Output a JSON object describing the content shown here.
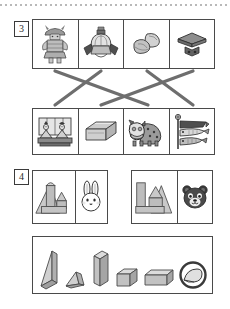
{
  "page": {
    "type": "worksheet",
    "top_rule": "dotted-line"
  },
  "question3": {
    "number": "3",
    "instruction_implied": "match-top-to-bottom-with-lines",
    "top_row": [
      {
        "id": "warrior-doll",
        "label": "musha-ningyo",
        "icon": "samurai-armor-doll-icon"
      },
      {
        "id": "kabuto-helmet",
        "label": "kabuto",
        "icon": "kabuto-helmet-icon"
      },
      {
        "id": "kashiwa-mochi",
        "label": "kashiwa-mochi",
        "icon": "rice-cake-icon"
      },
      {
        "id": "masu-stand",
        "label": "sanbo-stand",
        "icon": "wooden-stand-icon"
      }
    ],
    "bottom_row": [
      {
        "id": "hina-dolls",
        "label": "hina-ningyo",
        "icon": "hina-doll-pair-icon"
      },
      {
        "id": "box",
        "label": "hako",
        "icon": "open-box-icon"
      },
      {
        "id": "shishimai",
        "label": "shishimai",
        "icon": "lion-dance-icon"
      },
      {
        "id": "koinobori",
        "label": "koinobori",
        "icon": "carp-streamer-icon"
      }
    ],
    "connections": [
      {
        "from": 0,
        "to": 2
      },
      {
        "from": 1,
        "to": 0
      },
      {
        "from": 2,
        "to": 3
      },
      {
        "from": 3,
        "to": 1
      }
    ]
  },
  "question4": {
    "number": "4",
    "instruction_implied": "find-missing-block",
    "pairs": [
      {
        "id": "pair-a",
        "build": {
          "icon": "block-structure-a-icon",
          "label": "blocks-with-cylinder-and-triangle"
        },
        "face": {
          "icon": "rabbit-face-icon",
          "label": "usagi"
        }
      },
      {
        "id": "pair-b",
        "build": {
          "icon": "block-structure-b-icon",
          "label": "blocks-with-tall-bar-and-triangles"
        },
        "face": {
          "icon": "bear-face-icon",
          "label": "kuma"
        }
      }
    ],
    "shapes": [
      {
        "id": "shape-1",
        "icon": "right-triangular-prism-icon",
        "label": "triangular-prism-tall",
        "circled": false
      },
      {
        "id": "shape-2",
        "icon": "small-wedge-icon",
        "label": "small-wedge",
        "circled": false
      },
      {
        "id": "shape-3",
        "icon": "tall-rectangular-prism-icon",
        "label": "tall-bar",
        "circled": false
      },
      {
        "id": "shape-4",
        "icon": "cube-icon",
        "label": "cube",
        "circled": false
      },
      {
        "id": "shape-5",
        "icon": "rectangular-prism-icon",
        "label": "long-box",
        "circled": false
      },
      {
        "id": "shape-6",
        "icon": "half-cylinder-icon",
        "label": "half-cylinder",
        "circled": true
      }
    ],
    "answer_marked": "shape-6"
  },
  "colors": {
    "ink": "#3a3a3a",
    "line": "#4a4a4a",
    "connector": "#6e6e6e",
    "fill_light": "#d5d5d5",
    "fill_mid": "#bdbdbd",
    "fill_dark": "#9a9a9a"
  }
}
